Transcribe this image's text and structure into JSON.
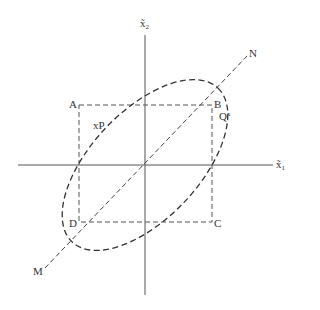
{
  "diagram": {
    "axes": {
      "x_label": "x̃",
      "x_sub": "1",
      "y_label": "x̃",
      "y_sub": "2"
    },
    "points": {
      "A": "A",
      "B": "B",
      "C": "C",
      "D": "D",
      "M": "M",
      "N": "N"
    },
    "regions": {
      "xP": "xP",
      "Q_base": "Q",
      "Q_sup": "x"
    },
    "colors": {
      "axis": "#555555",
      "dashed": "#444444",
      "text": "#333333"
    }
  }
}
